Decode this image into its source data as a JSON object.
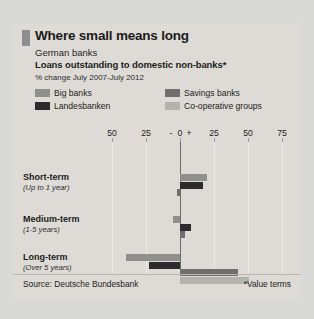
{
  "card": {
    "title": "Where small means long",
    "subtitle1": "German banks",
    "subtitle2": "Loans outstanding to domestic non-banks*",
    "units": "% change July 2007-July 2012",
    "source": "Source: Deutsche Bundesbank",
    "note": "*Value terms",
    "accent_color": "#8e8e8e",
    "background_color": "#dedbd6"
  },
  "legend": [
    {
      "label": "Big banks",
      "color": "#8f8f8d"
    },
    {
      "label": "Landesbanken",
      "color": "#2b2b2b"
    },
    {
      "label": "Savings banks",
      "color": "#6f6f6d"
    },
    {
      "label": "Co-operative groups",
      "color": "#b3b3b0"
    }
  ],
  "axis": {
    "labels": [
      "50",
      "25",
      "0",
      "25",
      "50",
      "75"
    ],
    "minus_sign": "-",
    "plus_sign": "+"
  },
  "groups": [
    {
      "name": "Short-term",
      "range": "(Up to 1 year)"
    },
    {
      "name": "Medium-term",
      "range": "(1-5 years)"
    },
    {
      "name": "Long-term",
      "range": "(Over 5 years)"
    }
  ],
  "chart_data": {
    "type": "bar",
    "orientation": "horizontal",
    "title": "Where small means long",
    "subtitle": "German banks — Loans outstanding to domestic non-banks*",
    "xlabel": "% change July 2007-July 2012",
    "ylabel": "",
    "xlim": [
      -50,
      75
    ],
    "xticks": [
      -50,
      -25,
      0,
      25,
      50,
      75
    ],
    "grid": true,
    "legend_position": "top",
    "categories": [
      "Short-term (Up to 1 year)",
      "Medium-term (1-5 years)",
      "Long-term (Over 5 years)"
    ],
    "series": [
      {
        "name": "Big banks",
        "color": "#8f8f8d",
        "values": [
          20,
          -5,
          -40
        ]
      },
      {
        "name": "Landesbanken",
        "color": "#2b2b2b",
        "values": [
          17,
          8,
          -23
        ]
      },
      {
        "name": "Savings banks",
        "color": "#6f6f6d",
        "values": [
          -2,
          4,
          43
        ]
      },
      {
        "name": "Co-operative groups",
        "color": "#b3b3b0",
        "values": [
          0,
          0,
          51
        ]
      }
    ]
  }
}
